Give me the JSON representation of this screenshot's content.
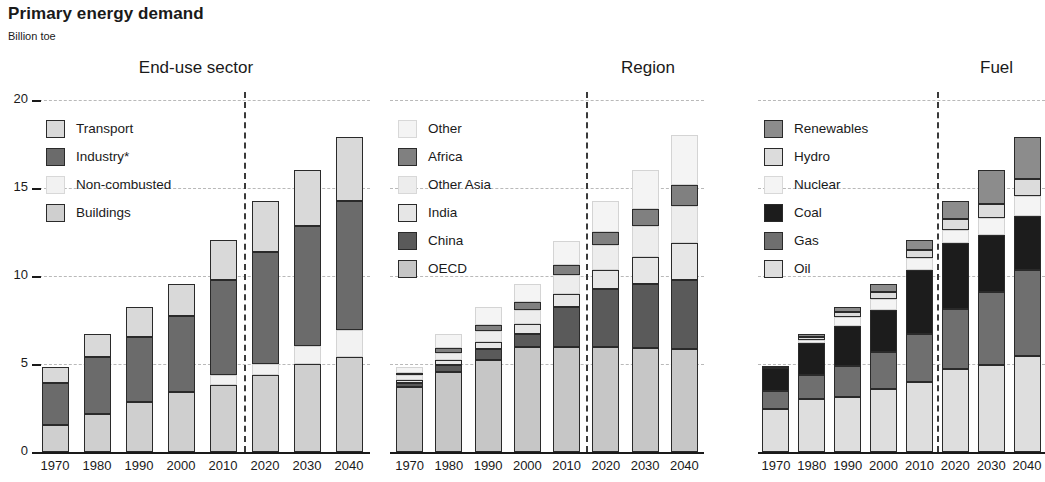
{
  "header": {
    "title": "Primary energy demand",
    "subtitle": "Billion toe"
  },
  "axis": {
    "y_ticks": [
      "0",
      "5",
      "10",
      "15",
      "20"
    ],
    "x_labels": [
      "1970",
      "1980",
      "1990",
      "2000",
      "2010",
      "2020",
      "2030",
      "2040"
    ]
  },
  "panels": [
    {
      "title": "End-use sector",
      "legend": [
        {
          "label": "Transport",
          "color": "#d9d9d9"
        },
        {
          "label": "Industry*",
          "color": "#6b6b6b"
        },
        {
          "label": "Non-combusted",
          "color": "#f2f2f2"
        },
        {
          "label": "Buildings",
          "color": "#cfcfcf"
        }
      ]
    },
    {
      "title": "Region",
      "legend": [
        {
          "label": "Other",
          "color": "#f4f4f4"
        },
        {
          "label": "Africa",
          "color": "#808080"
        },
        {
          "label": "Other Asia",
          "color": "#ededed"
        },
        {
          "label": "India",
          "color": "#e6e6e6"
        },
        {
          "label": "China",
          "color": "#5a5a5a"
        },
        {
          "label": "OECD",
          "color": "#c6c6c6"
        }
      ]
    },
    {
      "title": "Fuel",
      "legend": [
        {
          "label": "Renewables",
          "color": "#8c8c8c"
        },
        {
          "label": "Hydro",
          "color": "#dcdcdc"
        },
        {
          "label": "Nuclear",
          "color": "#f4f4f4"
        },
        {
          "label": "Coal",
          "color": "#1c1c1c"
        },
        {
          "label": "Gas",
          "color": "#6f6f6f"
        },
        {
          "label": "Oil",
          "color": "#dedede"
        }
      ]
    }
  ],
  "chart_data": [
    {
      "type": "bar",
      "title": "End-use sector",
      "stacked": true,
      "xlabel": "",
      "ylabel": "Billion toe",
      "ylim": [
        0,
        20
      ],
      "grid": true,
      "categories": [
        "1970",
        "1980",
        "1990",
        "2000",
        "2010",
        "2020",
        "2030",
        "2040"
      ],
      "series": [
        {
          "name": "Buildings",
          "color": "#cfcfcf",
          "values": [
            1.55,
            2.15,
            2.85,
            3.4,
            3.8,
            4.35,
            5.0,
            5.4
          ]
        },
        {
          "name": "Non-combusted",
          "color": "#f2f2f2",
          "values": [
            0.0,
            0.0,
            0.0,
            0.0,
            0.55,
            0.65,
            1.0,
            1.55
          ]
        },
        {
          "name": "Industry*",
          "color": "#6b6b6b",
          "values": [
            2.35,
            3.25,
            3.7,
            4.35,
            5.4,
            6.35,
            6.85,
            7.3
          ]
        },
        {
          "name": "Transport",
          "color": "#d9d9d9",
          "values": [
            0.95,
            1.3,
            1.7,
            1.8,
            2.3,
            2.9,
            3.2,
            3.65
          ]
        }
      ],
      "totals": [
        4.85,
        6.7,
        8.25,
        9.55,
        12.05,
        14.25,
        16.05,
        17.9
      ]
    },
    {
      "type": "bar",
      "title": "Region",
      "stacked": true,
      "xlabel": "",
      "ylabel": "Billion toe",
      "ylim": [
        0,
        20
      ],
      "grid": true,
      "categories": [
        "1970",
        "1980",
        "1990",
        "2000",
        "2010",
        "2020",
        "2030",
        "2040"
      ],
      "series": [
        {
          "name": "OECD",
          "color": "#c6c6c6",
          "values": [
            3.7,
            4.55,
            5.25,
            5.95,
            5.95,
            5.95,
            5.9,
            5.85
          ]
        },
        {
          "name": "China",
          "color": "#5a5a5a",
          "values": [
            0.2,
            0.4,
            0.6,
            0.75,
            2.3,
            3.3,
            3.65,
            3.95
          ]
        },
        {
          "name": "India",
          "color": "#e6e6e6",
          "values": [
            0.2,
            0.3,
            0.4,
            0.55,
            0.75,
            1.1,
            1.55,
            2.1
          ]
        },
        {
          "name": "Other Asia",
          "color": "#ededed",
          "values": [
            0.25,
            0.4,
            0.6,
            0.8,
            1.05,
            1.4,
            1.75,
            2.05
          ]
        },
        {
          "name": "Africa",
          "color": "#808080",
          "values": [
            0.15,
            0.25,
            0.35,
            0.45,
            0.6,
            0.75,
            0.95,
            1.2
          ]
        },
        {
          "name": "Other",
          "color": "#f4f4f4",
          "values": [
            0.35,
            0.8,
            1.05,
            1.05,
            1.35,
            1.75,
            2.25,
            2.85
          ]
        }
      ],
      "totals": [
        4.85,
        6.7,
        8.25,
        9.55,
        12.0,
        14.25,
        16.05,
        18.0
      ]
    },
    {
      "type": "bar",
      "title": "Fuel",
      "stacked": true,
      "xlabel": "",
      "ylabel": "Billion toe",
      "ylim": [
        0,
        20
      ],
      "grid": true,
      "categories": [
        "1970",
        "1980",
        "1990",
        "2000",
        "2010",
        "2020",
        "2030",
        "2040"
      ],
      "series": [
        {
          "name": "Oil",
          "color": "#dedede",
          "values": [
            2.45,
            3.0,
            3.15,
            3.6,
            4.0,
            4.7,
            4.95,
            5.45
          ]
        },
        {
          "name": "Gas",
          "color": "#6f6f6f",
          "values": [
            1.0,
            1.35,
            1.75,
            2.1,
            2.7,
            3.45,
            4.15,
            4.9
          ]
        },
        {
          "name": "Coal",
          "color": "#1c1c1c",
          "values": [
            1.3,
            1.85,
            2.25,
            2.35,
            3.65,
            3.7,
            3.25,
            3.05
          ]
        },
        {
          "name": "Nuclear",
          "color": "#f4f4f4",
          "values": [
            0.0,
            0.15,
            0.5,
            0.65,
            0.65,
            0.75,
            0.95,
            1.15
          ]
        },
        {
          "name": "Hydro",
          "color": "#dcdcdc",
          "values": [
            0.1,
            0.2,
            0.3,
            0.4,
            0.5,
            0.65,
            0.8,
            0.95
          ]
        },
        {
          "name": "Renewables",
          "color": "#8c8c8c",
          "values": [
            0.0,
            0.15,
            0.3,
            0.45,
            0.55,
            1.0,
            1.95,
            2.4
          ]
        }
      ],
      "totals": [
        4.85,
        6.7,
        8.25,
        9.55,
        12.05,
        14.25,
        16.05,
        17.9
      ]
    }
  ]
}
